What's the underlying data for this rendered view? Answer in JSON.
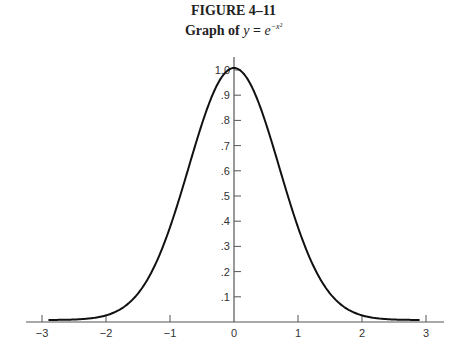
{
  "figure": {
    "label": "FIGURE 4–11",
    "caption_prefix": "Graph of ",
    "caption_math": "y = e^{-x^2}"
  },
  "chart_data": {
    "type": "line",
    "figure_label": "FIGURE 4-11",
    "xlabel": "",
    "ylabel": "",
    "xlim": [
      -3,
      3
    ],
    "ylim": [
      0,
      1.0
    ],
    "grid": false,
    "legend": null,
    "x_ticks": [
      -3,
      -2,
      -1,
      0,
      1,
      2,
      3
    ],
    "x_tick_labels": [
      "−3",
      "−2",
      "−1",
      "0",
      "1",
      "2",
      "3"
    ],
    "y_ticks": [
      0.1,
      0.2,
      0.3,
      0.4,
      0.5,
      0.6,
      0.7,
      0.8,
      0.9,
      1.0
    ],
    "y_tick_labels": [
      ".1",
      ".2",
      ".3",
      ".4",
      ".5",
      ".6",
      ".7",
      ".8",
      ".9",
      "1.0"
    ],
    "series": [
      {
        "name": "y = e^(-x^2)",
        "x": [
          -2.9,
          -2.5,
          -2.0,
          -1.5,
          -1.0,
          -0.5,
          0.0,
          0.5,
          1.0,
          1.5,
          2.0,
          2.5,
          2.9
        ],
        "values": [
          0.0002,
          0.0019,
          0.0183,
          0.1054,
          0.3679,
          0.7788,
          1.0,
          0.7788,
          0.3679,
          0.1054,
          0.0183,
          0.0019,
          0.0002
        ]
      }
    ]
  }
}
